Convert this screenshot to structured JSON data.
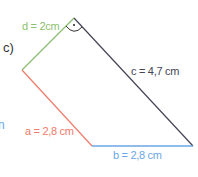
{
  "part_label": "c)",
  "cut_text": "n",
  "sides": {
    "a": {
      "label": "a = 2,8 cm",
      "color": "#f07a6a"
    },
    "b": {
      "label": "b = 2,8 cm",
      "color": "#6aa6e6"
    },
    "c": {
      "label": "c = 4,7 cm",
      "color": "#444455"
    },
    "d": {
      "label": "d = 2cm",
      "color": "#8cc06e"
    }
  },
  "right_angle_marker": "·",
  "bottom_partial": "ᵔ"
}
